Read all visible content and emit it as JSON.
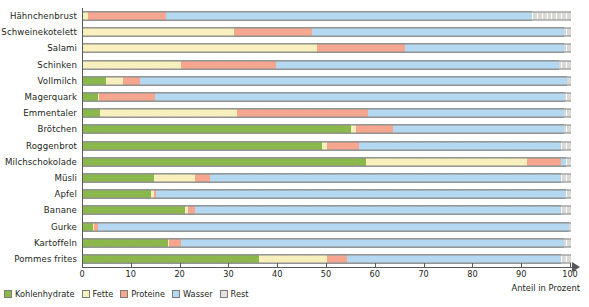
{
  "chart_data": {
    "type": "bar",
    "orientation": "horizontal",
    "stacked": true,
    "title": "",
    "xlabel": "Anteil in Prozent",
    "ylabel": "Nahrungsmittel (jeweils 100 g)",
    "xlim": [
      0,
      100
    ],
    "xticks": [
      0,
      10,
      20,
      30,
      40,
      50,
      60,
      70,
      80,
      90,
      100
    ],
    "grid": true,
    "legend_position": "bottom-left",
    "series": [
      {
        "name": "Kohlenhydrate",
        "color": "#8ab84b"
      },
      {
        "name": "Fette",
        "color": "#f7f0bd"
      },
      {
        "name": "Proteine",
        "color": "#f6a68e"
      },
      {
        "name": "Wasser",
        "color": "#b4d8ef"
      },
      {
        "name": "Rest",
        "color": "#d9d9d6"
      }
    ],
    "categories": [
      "Hähnchenbrust",
      "Schweinekotelett",
      "Salami",
      "Schinken",
      "Vollmilch",
      "Magerquark",
      "Emmentaler",
      "Brötchen",
      "Roggenbrot",
      "Milchschokolade",
      "Müsli",
      "Apfel",
      "Banane",
      "Gurke",
      "Kartoffeln",
      "Pommes frites"
    ],
    "values": [
      {
        "label": "Hähnchenbrust",
        "Kohlenhydrate": 0,
        "Fette": 1.0,
        "Proteine": 16.0,
        "Wasser": 75.0,
        "Rest": 8.0
      },
      {
        "label": "Schweinekotelett",
        "Kohlenhydrate": 0,
        "Fette": 31.0,
        "Proteine": 16.0,
        "Wasser": 51.5,
        "Rest": 1.5
      },
      {
        "label": "Salami",
        "Kohlenhydrate": 0,
        "Fette": 48.0,
        "Proteine": 18.0,
        "Wasser": 32.5,
        "Rest": 1.5
      },
      {
        "label": "Schinken",
        "Kohlenhydrate": 0,
        "Fette": 20.0,
        "Proteine": 19.5,
        "Wasser": 58.0,
        "Rest": 2.5
      },
      {
        "label": "Vollmilch",
        "Kohlenhydrate": 4.7,
        "Fette": 3.5,
        "Proteine": 3.5,
        "Wasser": 87.5,
        "Rest": 0.8
      },
      {
        "label": "Magerquark",
        "Kohlenhydrate": 3.0,
        "Fette": 0.3,
        "Proteine": 11.5,
        "Wasser": 84.0,
        "Rest": 1.2
      },
      {
        "label": "Emmentaler",
        "Kohlenhydrate": 3.5,
        "Fette": 28.0,
        "Proteine": 27.0,
        "Wasser": 40.0,
        "Rest": 1.5
      },
      {
        "label": "Brötchen",
        "Kohlenhydrate": 55.0,
        "Fette": 1.0,
        "Proteine": 7.5,
        "Wasser": 35.0,
        "Rest": 1.5
      },
      {
        "label": "Roggenbrot",
        "Kohlenhydrate": 49.0,
        "Fette": 1.0,
        "Proteine": 6.5,
        "Wasser": 41.5,
        "Rest": 2.0
      },
      {
        "label": "Milchschokolade",
        "Kohlenhydrate": 58.0,
        "Fette": 33.0,
        "Proteine": 7.0,
        "Wasser": 1.0,
        "Rest": 1.0
      },
      {
        "label": "Müsli",
        "Kohlenhydrate": 14.5,
        "Fette": 8.5,
        "Proteine": 3.0,
        "Wasser": 72.0,
        "Rest": 2.0
      },
      {
        "label": "Apfel",
        "Kohlenhydrate": 14.0,
        "Fette": 0.5,
        "Proteine": 0.5,
        "Wasser": 84.0,
        "Rest": 1.0
      },
      {
        "label": "Banane",
        "Kohlenhydrate": 21.0,
        "Fette": 0.5,
        "Proteine": 1.5,
        "Wasser": 75.0,
        "Rest": 2.0
      },
      {
        "label": "Gurke",
        "Kohlenhydrate": 2.0,
        "Fette": 0.3,
        "Proteine": 0.7,
        "Wasser": 96.5,
        "Rest": 0.5
      },
      {
        "label": "Kartoffeln",
        "Kohlenhydrate": 17.5,
        "Fette": 0.2,
        "Proteine": 2.3,
        "Wasser": 78.5,
        "Rest": 1.5
      },
      {
        "label": "Pommes frites",
        "Kohlenhydrate": 36.0,
        "Fette": 14.0,
        "Proteine": 4.0,
        "Wasser": 44.0,
        "Rest": 2.0
      }
    ]
  },
  "axis": {
    "y_title": "Nahrungsmittel (jeweils 100 g)",
    "x_title": "Anteil in Prozent",
    "x_tick_labels": [
      "0",
      "10",
      "20",
      "30",
      "40",
      "50",
      "60",
      "70",
      "80",
      "90",
      "100"
    ]
  },
  "legend": {
    "items": [
      {
        "label": "Kohlenhydrate",
        "color": "#8ab84b"
      },
      {
        "label": "Fette",
        "color": "#f7f0bd"
      },
      {
        "label": "Proteine",
        "color": "#f6a68e"
      },
      {
        "label": "Wasser",
        "color": "#b4d8ef"
      },
      {
        "label": "Rest",
        "color": "#e3e3e0"
      }
    ]
  }
}
